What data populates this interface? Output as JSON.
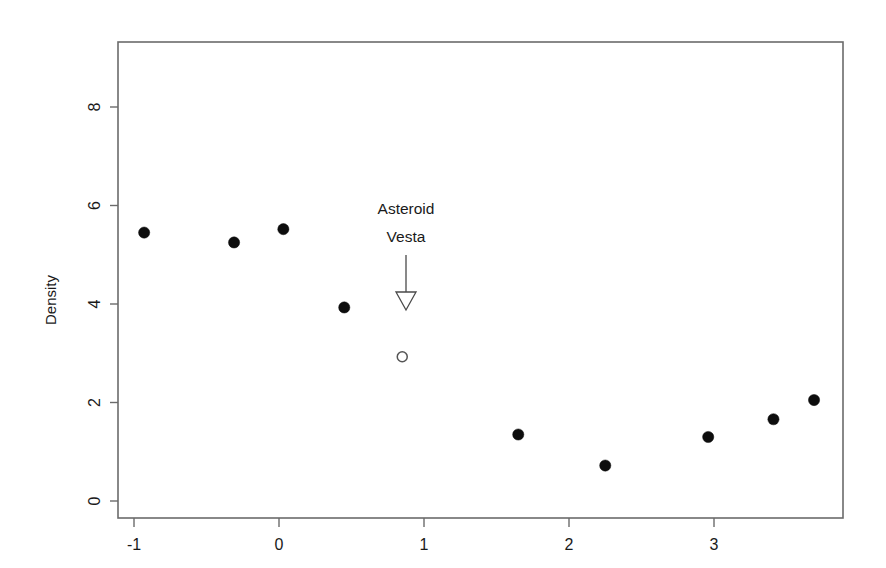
{
  "chart_data": {
    "type": "scatter",
    "title": "",
    "xlabel": "",
    "ylabel": "Density",
    "xlim": [
      -1.32,
      3.93
    ],
    "ylim": [
      -0.33,
      9.33
    ],
    "grid": false,
    "legend": null,
    "x_ticks": [
      "-1",
      "0",
      "1",
      "2",
      "3"
    ],
    "x_tick_values": [
      -1,
      0,
      1,
      2,
      3
    ],
    "y_ticks": [
      "0",
      "2",
      "4",
      "6",
      "8"
    ],
    "y_tick_values": [
      0,
      2,
      4,
      6,
      8
    ],
    "series": [
      {
        "name": "Solar system bodies",
        "marker": "filled-circle",
        "color": "#0d0d0d",
        "points": [
          {
            "x": -0.93,
            "y": 5.45
          },
          {
            "x": -0.31,
            "y": 5.25
          },
          {
            "x": 0.03,
            "y": 5.52
          },
          {
            "x": 0.45,
            "y": 3.93
          },
          {
            "x": 1.65,
            "y": 1.35
          },
          {
            "x": 2.25,
            "y": 0.72
          },
          {
            "x": 2.96,
            "y": 1.3
          },
          {
            "x": 3.41,
            "y": 1.66
          },
          {
            "x": 3.69,
            "y": 2.05
          }
        ]
      },
      {
        "name": "Asteroid Vesta",
        "marker": "open-circle",
        "color": "#555555",
        "points": [
          {
            "x": 0.85,
            "y": 2.93
          }
        ]
      }
    ],
    "annotations": [
      {
        "text_line1": "Asteroid",
        "text_line2": "Vesta",
        "text_x": 0.85,
        "text_y": 6.2,
        "arrow_from_y": 5.5,
        "arrow_to_y": 4.3,
        "arrow_x": 0.85,
        "arrow_style": "open-head-down"
      }
    ]
  },
  "axis": {
    "y_title": "Density"
  },
  "annotation": {
    "line1": "Asteroid",
    "line2": "Vesta"
  }
}
